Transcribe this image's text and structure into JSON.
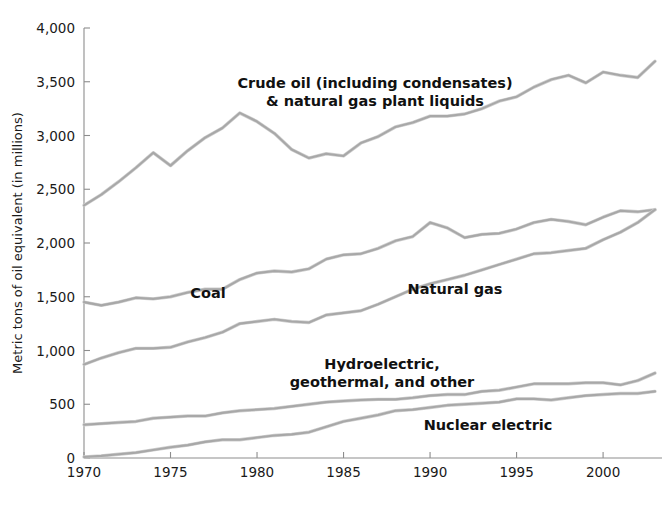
{
  "chart_data": {
    "type": "line",
    "title": "",
    "subtitle": "",
    "xlabel": "",
    "ylabel": "Metric tons of oil equivalent (in millions)",
    "xlim": [
      1970,
      2003
    ],
    "ylim": [
      0,
      4000
    ],
    "grid": false,
    "legend_position": "inline-labels",
    "x_ticks": [
      "1970",
      "1975",
      "1980",
      "1985",
      "1990",
      "1995",
      "2000"
    ],
    "x_tick_values": [
      1970,
      1975,
      1980,
      1985,
      1990,
      1995,
      2000
    ],
    "y_ticks": [
      "0",
      "500",
      "1,000",
      "1,500",
      "2,000",
      "2,500",
      "3,000",
      "3,500",
      "4,000"
    ],
    "y_tick_values": [
      0,
      500,
      1000,
      1500,
      2000,
      2500,
      3000,
      3500,
      4000
    ],
    "x": [
      1970,
      1971,
      1972,
      1973,
      1974,
      1975,
      1976,
      1977,
      1978,
      1979,
      1980,
      1981,
      1982,
      1983,
      1984,
      1985,
      1986,
      1987,
      1988,
      1989,
      1990,
      1991,
      1992,
      1993,
      1994,
      1995,
      1996,
      1997,
      1998,
      1999,
      2000,
      2001,
      2002,
      2003
    ],
    "series": [
      {
        "name": "Crude oil (including condensates) & natural gas plant liquids",
        "label": "Crude oil (including condensates)\n& natural gas plant liquids",
        "label_line1": "Crude oil (including condensates)",
        "label_line2": "& natural gas plant liquids",
        "color": "#a8a8a8",
        "values": [
          2350,
          2450,
          2570,
          2700,
          2840,
          2720,
          2860,
          2980,
          3070,
          3210,
          3130,
          3020,
          2870,
          2790,
          2830,
          2810,
          2930,
          2990,
          3080,
          3120,
          3180,
          3180,
          3200,
          3250,
          3320,
          3360,
          3450,
          3520,
          3560,
          3490,
          3590,
          3560,
          3540,
          3690
        ]
      },
      {
        "name": "Coal",
        "label": "Coal",
        "color": "#a8a8a8",
        "values": [
          1450,
          1420,
          1450,
          1490,
          1480,
          1500,
          1540,
          1570,
          1570,
          1660,
          1720,
          1740,
          1730,
          1760,
          1850,
          1890,
          1900,
          1950,
          2020,
          2060,
          2190,
          2140,
          2050,
          2080,
          2090,
          2130,
          2190,
          2220,
          2200,
          2170,
          2240,
          2300,
          2290,
          2310
        ]
      },
      {
        "name": "Natural gas",
        "label": "Natural gas",
        "color": "#a8a8a8",
        "values": [
          870,
          930,
          980,
          1020,
          1020,
          1030,
          1080,
          1120,
          1170,
          1250,
          1270,
          1290,
          1270,
          1260,
          1330,
          1350,
          1370,
          1430,
          1500,
          1570,
          1620,
          1660,
          1700,
          1750,
          1800,
          1850,
          1900,
          1910,
          1930,
          1950,
          2030,
          2100,
          2190,
          2310
        ]
      },
      {
        "name": "Hydroelectric, geothermal, and other",
        "label": "Hydroelectric,\ngeothermal, and other",
        "label_line1": "Hydroelectric,",
        "label_line2": "geothermal, and other",
        "color": "#a8a8a8",
        "values": [
          310,
          320,
          330,
          340,
          370,
          380,
          390,
          390,
          420,
          440,
          450,
          460,
          480,
          500,
          520,
          530,
          540,
          545,
          545,
          560,
          580,
          590,
          590,
          620,
          630,
          660,
          690,
          690,
          690,
          700,
          700,
          680,
          720,
          790
        ]
      },
      {
        "name": "Nuclear electric",
        "label": "Nuclear electric",
        "color": "#a8a8a8",
        "values": [
          10,
          20,
          35,
          50,
          75,
          100,
          120,
          150,
          170,
          170,
          190,
          210,
          220,
          240,
          290,
          340,
          370,
          400,
          440,
          450,
          470,
          490,
          500,
          510,
          520,
          550,
          550,
          540,
          560,
          580,
          590,
          600,
          600,
          620
        ]
      }
    ],
    "series_label_positions": [
      {
        "series": "Crude oil (including condensates) & natural gas plant liquids",
        "x": 375,
        "y": 88
      },
      {
        "series": "Coal",
        "x": 208,
        "y": 298
      },
      {
        "series": "Natural gas",
        "x": 455,
        "y": 294
      },
      {
        "series": "Hydroelectric, geothermal, and other",
        "x": 382,
        "y": 369
      },
      {
        "series": "Nuclear electric",
        "x": 488,
        "y": 430
      }
    ]
  }
}
